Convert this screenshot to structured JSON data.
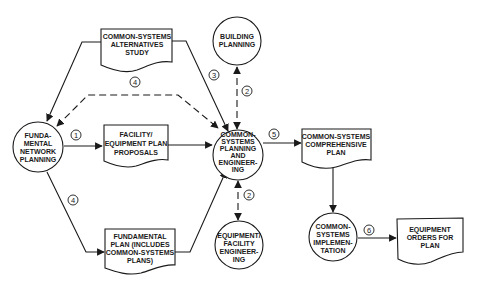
{
  "diagram": {
    "type": "flowchart",
    "nodes": {
      "fundamental_network_planning": {
        "shape": "circle",
        "lines": [
          "FUNDA-",
          "MENTAL",
          "NETWORK",
          "PLANNING"
        ]
      },
      "alternatives_study": {
        "shape": "document",
        "lines": [
          "COMMON-SYSTEMS",
          "ALTERNATIVES",
          "STUDY"
        ]
      },
      "building_planning": {
        "shape": "circle",
        "lines": [
          "BUILDING",
          "PLANNING"
        ]
      },
      "facility_equipment_proposals": {
        "shape": "document",
        "lines": [
          "FACILITY/",
          "EQUIPMENT PLAN",
          "PROPOSALS"
        ]
      },
      "common_systems_planning": {
        "shape": "circle",
        "lines": [
          "COMMON-",
          "SYSTEMS",
          "PLANNING",
          "AND",
          "ENGINEER-",
          "ING"
        ]
      },
      "comprehensive_plan": {
        "shape": "document",
        "lines": [
          "COMMON-SYSTEMS",
          "COMPREHENSIVE",
          "PLAN"
        ]
      },
      "fundamental_plan": {
        "shape": "document",
        "lines": [
          "FUNDAMENTAL",
          "PLAN (INCLUDES",
          "COMMON-SYSTEMS",
          "PLANS)"
        ]
      },
      "equipment_facility_engineering": {
        "shape": "circle",
        "lines": [
          "EQUIPMENT/",
          "FACILITY",
          "ENGINEER-",
          "ING"
        ]
      },
      "implementation": {
        "shape": "circle",
        "lines": [
          "COMMON-",
          "SYSTEMS",
          "IMPLEMEN-",
          "TATION"
        ]
      },
      "equipment_orders": {
        "shape": "document",
        "lines": [
          "EQUIPMENT",
          "ORDERS FOR",
          "PLAN"
        ]
      }
    },
    "edges": [
      {
        "from": "alternatives_study",
        "to": "fundamental_network_planning",
        "style": "solid",
        "label": ""
      },
      {
        "from": "alternatives_study",
        "to": "common_systems_planning",
        "style": "solid",
        "label": "3"
      },
      {
        "from": "common_systems_planning",
        "to": "fundamental_network_planning",
        "style": "dashed",
        "label": "4",
        "bidirectional": true
      },
      {
        "from": "fundamental_network_planning",
        "to": "facility_equipment_proposals",
        "style": "solid",
        "label": "1"
      },
      {
        "from": "facility_equipment_proposals",
        "to": "common_systems_planning",
        "style": "solid",
        "label": ""
      },
      {
        "from": "fundamental_network_planning",
        "to": "fundamental_plan",
        "style": "solid",
        "label": "4"
      },
      {
        "from": "fundamental_plan",
        "to": "common_systems_planning",
        "style": "solid",
        "label": ""
      },
      {
        "from": "building_planning",
        "to": "common_systems_planning",
        "style": "dashed",
        "label": "2",
        "bidirectional": true
      },
      {
        "from": "common_systems_planning",
        "to": "equipment_facility_engineering",
        "style": "dashed",
        "label": "2",
        "bidirectional": true
      },
      {
        "from": "common_systems_planning",
        "to": "comprehensive_plan",
        "style": "solid",
        "label": "5"
      },
      {
        "from": "comprehensive_plan",
        "to": "implementation",
        "style": "solid",
        "label": ""
      },
      {
        "from": "implementation",
        "to": "equipment_orders",
        "style": "solid",
        "label": "6"
      }
    ],
    "step_labels": {
      "s1": "1",
      "s2a": "2",
      "s2b": "2",
      "s3": "3",
      "s4a": "4",
      "s4b": "4",
      "s5": "5",
      "s6": "6"
    }
  },
  "colors": {
    "line": "#1a1a1a",
    "background": "#ffffff"
  }
}
